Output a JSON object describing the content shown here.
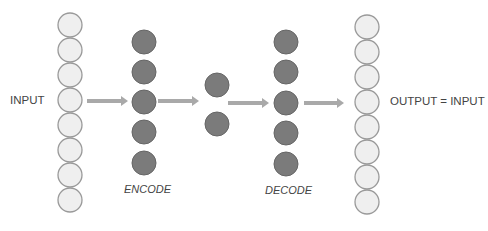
{
  "diagram": {
    "type": "autoencoder",
    "labels": {
      "input": "INPUT",
      "output": "OUTPUT = INPUT",
      "encode": "ENCODE",
      "decode": "DECODE"
    },
    "layers": [
      {
        "name": "input",
        "nodes": 8,
        "cx": 70,
        "cy": [
          25,
          50,
          75,
          100,
          125,
          150,
          175,
          200
        ],
        "style": "light"
      },
      {
        "name": "encode",
        "nodes": 5,
        "cx": 144,
        "cy": [
          42,
          72,
          102,
          132,
          163
        ],
        "style": "dark"
      },
      {
        "name": "code",
        "nodes": 2,
        "cx": 217,
        "cy": [
          85,
          124
        ],
        "style": "dark"
      },
      {
        "name": "decode",
        "nodes": 5,
        "cx": 286,
        "cy": [
          42,
          72,
          103,
          133,
          164
        ],
        "style": "dark"
      },
      {
        "name": "output",
        "nodes": 8,
        "cx": 367,
        "cy": [
          27,
          52,
          77,
          102,
          127,
          152,
          177,
          202
        ],
        "style": "light"
      }
    ],
    "arrows": [
      {
        "x1": 87,
        "x2": 128,
        "y": 101
      },
      {
        "x1": 158,
        "x2": 199,
        "y": 101
      },
      {
        "x1": 228,
        "x2": 269,
        "y": 103
      },
      {
        "x1": 304,
        "x2": 344,
        "y": 103
      }
    ],
    "colors": {
      "light_fill": "#efefef",
      "light_stroke": "#9a9a9a",
      "dark_fill": "#7b7b7b",
      "dark_stroke": "#666666",
      "arrow": "#a9a9a9",
      "text": "#444444"
    },
    "node_radius": 12
  }
}
